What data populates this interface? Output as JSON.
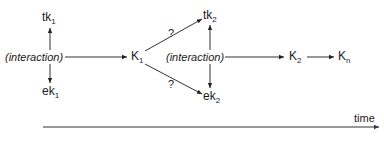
{
  "diagram": {
    "nodes": {
      "tk1": {
        "base": "tk",
        "sub": "1"
      },
      "ek1": {
        "base": "ek",
        "sub": "1"
      },
      "interaction1": {
        "label": "(interaction)"
      },
      "K1": {
        "base": "K",
        "sub": "1"
      },
      "tk2": {
        "base": "tk",
        "sub": "2"
      },
      "ek2": {
        "base": "ek",
        "sub": "2"
      },
      "interaction2": {
        "label": "(interaction)"
      },
      "K2": {
        "base": "K",
        "sub": "2"
      },
      "Kn": {
        "base": "K",
        "sub": "n"
      }
    },
    "uncertain_labels": {
      "upper": "?",
      "lower": "?"
    },
    "time_axis": {
      "label": "time"
    },
    "edges": [
      {
        "from": "interaction1",
        "to": "tk1"
      },
      {
        "from": "interaction1",
        "to": "ek1"
      },
      {
        "from": "interaction1",
        "to": "K1"
      },
      {
        "from": "K1",
        "to": "tk2",
        "label": "?"
      },
      {
        "from": "K1",
        "to": "ek2",
        "label": "?"
      },
      {
        "from": "interaction2",
        "to": "tk2"
      },
      {
        "from": "interaction2",
        "to": "ek2"
      },
      {
        "from": "interaction2",
        "to": "K2"
      },
      {
        "from": "K2",
        "to": "Kn"
      }
    ],
    "colors": {
      "line": "#333333",
      "axis": "#777777",
      "text": "#1a1a1a"
    }
  }
}
